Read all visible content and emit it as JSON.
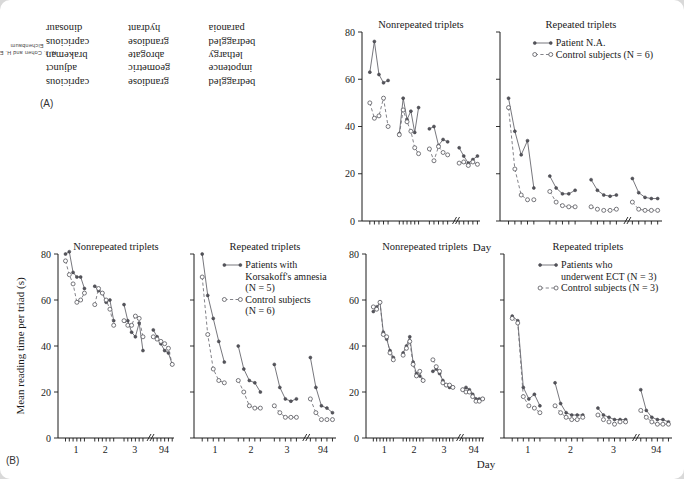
{
  "page": {
    "side_credit": "N. J. Cohen and H. E. Eichenbaum",
    "panel_a_label": "(A)",
    "panel_b_label": "(B)",
    "background_color": "#d9d9d9",
    "page_color": "#ffffff"
  },
  "panel_a": {
    "name": "mirror-reading-word-triplets",
    "note": "words shown mirror-reversed",
    "rows": [
      [
        "bedraggled",
        "grandiose",
        "capricious"
      ],
      [
        "impotence",
        "geometric",
        "adjunct"
      ],
      [
        "lethargy",
        "abrogate",
        "brakeman"
      ],
      [
        "bedraggled",
        "grandiose",
        "capricious"
      ],
      [
        "paranoia",
        "hydrant",
        "dinosaur"
      ]
    ]
  },
  "axis": {
    "y_ticks": [
      0,
      20,
      40,
      60,
      80
    ],
    "y_label": "Mean reading time per triad (s)",
    "x_label": "Day",
    "x_tick_labels": [
      "1",
      "2",
      "3",
      "94"
    ],
    "x_break_symbol": "//",
    "ylim": [
      0,
      80
    ]
  },
  "chart_data": [
    {
      "id": "na-nonrepeated",
      "type": "line",
      "title": "Nonrepeated triplets",
      "row": "top",
      "ylabel": "Mean reading time per triad (s)",
      "xlabel": "Day",
      "ylim": [
        0,
        80
      ],
      "show_y_labels": true,
      "show_x_labels": false,
      "legend": [],
      "series": [
        {
          "name": "Patient N.A.",
          "marker": "filled",
          "line": "solid",
          "blocks": [
            [
              63,
              76,
              62,
              58.5,
              59.5
            ],
            [
              37,
              52,
              43,
              46.5,
              37.5,
              48
            ],
            [
              39,
              40,
              32,
              34.5,
              33.5
            ],
            [
              31,
              27.5,
              24.5,
              26,
              27.5
            ]
          ]
        },
        {
          "name": "Control subjects (N = 6)",
          "marker": "open",
          "line": "dashed",
          "blocks": [
            [
              50,
              43.5,
              44.5,
              52,
              40
            ],
            [
              36.5,
              47,
              42,
              38,
              31,
              28.5
            ],
            [
              30.5,
              25.5,
              31.5,
              29,
              28
            ],
            [
              24.5,
              25,
              23.5,
              25,
              24
            ]
          ]
        }
      ]
    },
    {
      "id": "na-repeated",
      "type": "line",
      "title": "Repeated triplets",
      "row": "top",
      "ylim": [
        0,
        80
      ],
      "show_y_labels": false,
      "show_x_labels": false,
      "legend": [
        {
          "label": "Patient N.A.",
          "marker": "filled",
          "line": "solid"
        },
        {
          "label": "Control subjects (N = 6)",
          "marker": "open",
          "line": "dashed"
        }
      ],
      "series": [
        {
          "name": "Patient N.A.",
          "marker": "filled",
          "line": "solid",
          "blocks": [
            [
              52,
              38,
              28,
              34,
              14
            ],
            [
              19,
              14,
              11.5,
              11.5,
              13
            ],
            [
              17.5,
              13,
              11,
              10.5,
              11
            ],
            [
              18,
              12,
              10,
              9.5,
              9.5
            ]
          ]
        },
        {
          "name": "Control subjects (N = 6)",
          "marker": "open",
          "line": "dashed",
          "blocks": [
            [
              48,
              22,
              11,
              9,
              9
            ],
            [
              12.5,
              8,
              6.5,
              6,
              6
            ],
            [
              6,
              5,
              4.5,
              4.5,
              5
            ],
            [
              8,
              5,
              4.5,
              4.5,
              4.5
            ]
          ]
        }
      ]
    },
    {
      "id": "korsakoff-nonrepeated",
      "type": "line",
      "title": "Nonrepeated triplets",
      "row": "bottom",
      "ylabel": "Mean reading time per triad (s)",
      "ylim": [
        0,
        80
      ],
      "show_y_labels": true,
      "show_x_labels": true,
      "legend": [],
      "series": [
        {
          "name": "Patients with Korsakoff's amnesia (N = 5)",
          "marker": "filled",
          "line": "solid",
          "blocks": [
            [
              80,
              81,
              72,
              70,
              70,
              65
            ],
            [
              66,
              64,
              63,
              59,
              60,
              51
            ],
            [
              58,
              51,
              46,
              44,
              50,
              38
            ],
            [
              47,
              44,
              41,
              38,
              37,
              32
            ]
          ]
        },
        {
          "name": "Control subjects (N = 6)",
          "marker": "open",
          "line": "dashed",
          "blocks": [
            [
              77,
              71,
              67,
              59,
              60,
              63
            ],
            [
              58,
              65,
              63,
              60,
              56,
              49
            ],
            [
              51,
              49,
              49,
              53,
              52,
              44
            ],
            [
              44,
              43,
              42,
              41,
              39,
              32
            ]
          ]
        }
      ]
    },
    {
      "id": "korsakoff-repeated",
      "type": "line",
      "title": "Repeated triplets",
      "row": "bottom",
      "ylim": [
        0,
        80
      ],
      "show_y_labels": false,
      "show_x_labels": true,
      "legend": [
        {
          "label": "Patients with",
          "marker": "filled",
          "line": "solid"
        },
        {
          "label": "Korsakoff's amnesia",
          "marker": "none",
          "line": "none"
        },
        {
          "label": "(N = 5)",
          "marker": "none",
          "line": "none"
        },
        {
          "label": "Control subjects",
          "marker": "open",
          "line": "dashed"
        },
        {
          "label": "(N = 6)",
          "marker": "none",
          "line": "none"
        }
      ],
      "series": [
        {
          "name": "Patients with Korsakoff's amnesia (N = 5)",
          "marker": "filled",
          "line": "solid",
          "blocks": [
            [
              80,
              62,
              52,
              42,
              33
            ],
            [
              40,
              30,
              25,
              24,
              20
            ],
            [
              32,
              22,
              17,
              16,
              17
            ],
            [
              35,
              22,
              14,
              13,
              11
            ]
          ]
        },
        {
          "name": "Control subjects (N = 6)",
          "marker": "open",
          "line": "dashed",
          "blocks": [
            [
              70,
              45,
              30,
              25,
              24
            ],
            [
              25,
              20,
              14,
              13,
              13
            ],
            [
              14,
              11,
              9,
              9,
              9
            ],
            [
              17,
              11,
              8,
              8,
              8
            ]
          ]
        }
      ]
    },
    {
      "id": "ect-nonrepeated",
      "type": "line",
      "title": "Nonrepeated triplets",
      "row": "bottom",
      "ylim": [
        0,
        80
      ],
      "show_y_labels": true,
      "show_x_labels": true,
      "xlabel": "Day",
      "legend": [],
      "series": [
        {
          "name": "Patients who underwent ECT (N = 3)",
          "marker": "filled",
          "line": "solid",
          "blocks": [
            [
              55,
              57,
              59,
              46,
              43,
              38,
              35
            ],
            [
              37,
              40,
              44,
              33,
              28,
              27,
              25
            ],
            [
              29,
              30,
              28,
              25,
              23,
              22,
              22
            ],
            [
              21,
              22,
              21,
              19,
              17,
              17,
              17
            ]
          ]
        },
        {
          "name": "Control subjects (N = 3)",
          "marker": "open",
          "line": "dashed",
          "blocks": [
            [
              57,
              56,
              59,
              45,
              44,
              37,
              34
            ],
            [
              36,
              39,
              42,
              32,
              27,
              29,
              25
            ],
            [
              34,
              31,
              29,
              24,
              23,
              23,
              22
            ],
            [
              21,
              20,
              20,
              18,
              16,
              16,
              17
            ]
          ]
        }
      ]
    },
    {
      "id": "ect-repeated",
      "type": "line",
      "title": "Repeated triplets",
      "row": "bottom",
      "ylim": [
        0,
        80
      ],
      "show_y_labels": false,
      "show_x_labels": true,
      "legend": [
        {
          "label": "Patients who",
          "marker": "filled",
          "line": "solid"
        },
        {
          "label": "underwent ECT (N = 3)",
          "marker": "none",
          "line": "none"
        },
        {
          "label": "Control subjects (N = 3)",
          "marker": "open",
          "line": "dashed"
        }
      ],
      "series": [
        {
          "name": "Patients who underwent ECT (N = 3)",
          "marker": "filled",
          "line": "solid",
          "blocks": [
            [
              53,
              51,
              22,
              17,
              19,
              14
            ],
            [
              24,
              15,
              11,
              10,
              10,
              10
            ],
            [
              13,
              10,
              9,
              8,
              8,
              8
            ],
            [
              21,
              12,
              9,
              8,
              8,
              7
            ]
          ]
        },
        {
          "name": "Control subjects (N = 3)",
          "marker": "open",
          "line": "dashed",
          "blocks": [
            [
              52,
              50,
              18,
              14,
              13,
              11
            ],
            [
              14,
              11,
              9,
              8,
              8,
              9
            ],
            [
              10,
              8,
              7,
              6,
              7,
              7
            ],
            [
              12,
              9,
              7,
              6,
              6,
              6
            ]
          ]
        }
      ]
    }
  ]
}
